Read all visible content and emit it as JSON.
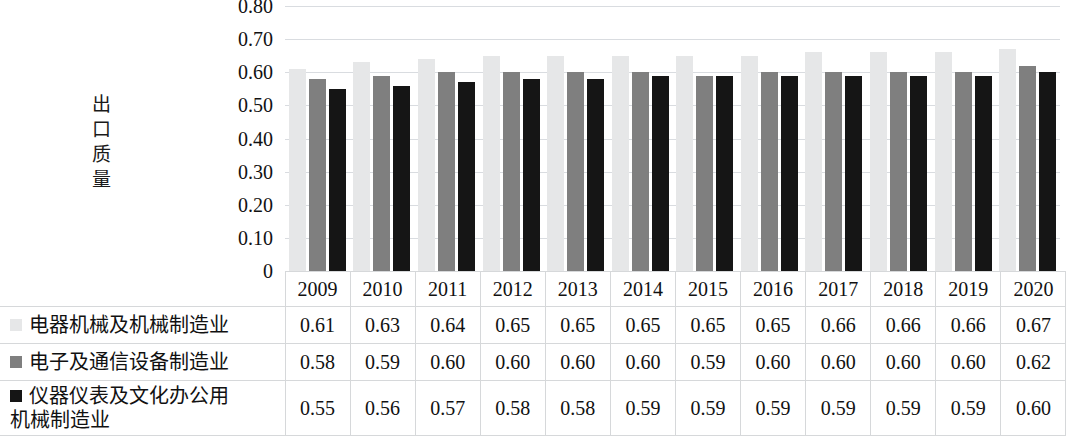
{
  "chart_data": {
    "type": "bar",
    "title": "",
    "subtitle": "",
    "xlabel": "",
    "ylabel": "出口质量",
    "ylim": [
      0,
      0.8
    ],
    "grid": true,
    "legend_position": "table-left",
    "categories": [
      "2009",
      "2010",
      "2011",
      "2012",
      "2013",
      "2014",
      "2015",
      "2016",
      "2017",
      "2018",
      "2019",
      "2020"
    ],
    "ytick_labels": [
      "0.80",
      "0.70",
      "0.60",
      "0.50",
      "0.40",
      "0.30",
      "0.20",
      "0.10",
      "0"
    ],
    "ytick_values": [
      0.8,
      0.7,
      0.6,
      0.5,
      0.4,
      0.3,
      0.2,
      0.1,
      0
    ],
    "series": [
      {
        "name": "电器机械及机械制造业",
        "color": "#e6e7e8",
        "values": [
          0.61,
          0.63,
          0.64,
          0.65,
          0.65,
          0.65,
          0.65,
          0.65,
          0.66,
          0.66,
          0.66,
          0.67
        ],
        "labels": [
          "0.61",
          "0.63",
          "0.64",
          "0.65",
          "0.65",
          "0.65",
          "0.65",
          "0.65",
          "0.66",
          "0.66",
          "0.66",
          "0.67"
        ]
      },
      {
        "name": "电子及通信设备制造业",
        "color": "#7f7f7f",
        "values": [
          0.58,
          0.59,
          0.6,
          0.6,
          0.6,
          0.6,
          0.59,
          0.6,
          0.6,
          0.6,
          0.6,
          0.62
        ],
        "labels": [
          "0.58",
          "0.59",
          "0.60",
          "0.60",
          "0.60",
          "0.60",
          "0.59",
          "0.60",
          "0.60",
          "0.60",
          "0.60",
          "0.62"
        ]
      },
      {
        "name": "仪器仪表及文化办公用机械制造业",
        "name_line1": "仪器仪表及文化办公用",
        "name_line2": "机械制造业",
        "color": "#151515",
        "values": [
          0.55,
          0.56,
          0.57,
          0.58,
          0.58,
          0.59,
          0.59,
          0.59,
          0.59,
          0.59,
          0.59,
          0.6
        ],
        "labels": [
          "0.55",
          "0.56",
          "0.57",
          "0.58",
          "0.58",
          "0.59",
          "0.59",
          "0.59",
          "0.59",
          "0.59",
          "0.59",
          "0.60"
        ]
      }
    ]
  }
}
